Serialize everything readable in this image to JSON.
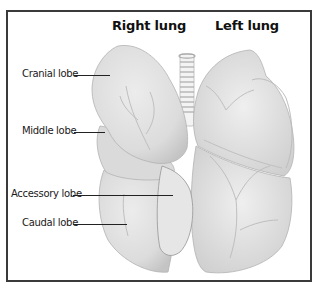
{
  "diagram": {
    "headings": {
      "right": "Right lung",
      "left": "Left lung"
    },
    "labels": [
      {
        "id": "cranial",
        "text": "Cranial lobe"
      },
      {
        "id": "middle",
        "text": "Middle lobe"
      },
      {
        "id": "accessory",
        "text": "Accessory lobe"
      },
      {
        "id": "caudal",
        "text": "Caudal lobe"
      }
    ],
    "colors": {
      "lung_fill": "#e2e2e2",
      "lung_shade": "#c8c8c8",
      "outline": "#b0b0b0",
      "vessels": "#bdbdbd",
      "frame": "#3a3a3a",
      "text": "#111111"
    }
  }
}
